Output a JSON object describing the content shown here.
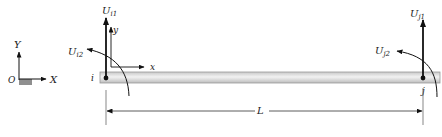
{
  "global_axes": {
    "y_label": "Y",
    "x_label": "X",
    "origin_label": "O"
  },
  "beam": {
    "node_i_label": "i",
    "node_j_label": "j",
    "length_label": "L",
    "fill_color": "#d9d9d9"
  },
  "local_axes": {
    "x_label": "x",
    "y_label": "y"
  },
  "dofs": {
    "ui1": {
      "main": "U",
      "sub": "i1"
    },
    "ui2": {
      "main": "U",
      "sub": "i2"
    },
    "uj1": {
      "main": "U",
      "sub": "j1"
    },
    "uj2": {
      "main": "U",
      "sub": "j2"
    }
  }
}
